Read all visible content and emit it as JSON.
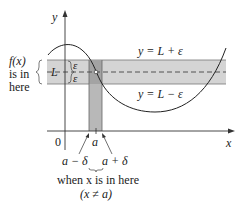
{
  "diagram": {
    "axes": {
      "x_label": "x",
      "y_label": "y",
      "origin_label": "0"
    },
    "band": {
      "center_label": "L",
      "upper_label": "y = L + ε",
      "lower_label": "y = L − ε",
      "epsilon_upper": "ε",
      "epsilon_lower": "ε"
    },
    "strip": {
      "center_label": "a",
      "left_label": "a − δ",
      "right_label": "a + δ"
    },
    "left_note": {
      "line1": "f(x)",
      "line2": "is in",
      "line3": "here"
    },
    "bottom_note": {
      "line1": "when x is in here",
      "line2": "(x ≠ a)"
    },
    "colors": {
      "band": "#d3d3d3",
      "strip": "#bdbdbd",
      "overlap": "#a8a8a8",
      "line": "#333333"
    }
  }
}
